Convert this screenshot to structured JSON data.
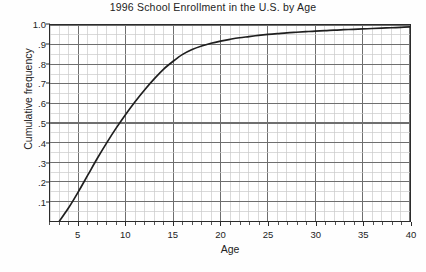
{
  "chart_data": {
    "type": "line",
    "title": "1996 School Enrollment in the U.S. by Age",
    "xlabel": "Age",
    "ylabel": "Cumulative frequency",
    "xlim": [
      2,
      40
    ],
    "ylim": [
      0,
      1.0
    ],
    "grid": true,
    "legend": null,
    "x_ticks": [
      5,
      10,
      15,
      20,
      25,
      30,
      35,
      40
    ],
    "x_tick_labels": [
      "5",
      "10",
      "15",
      "20",
      "25",
      "30",
      "35",
      "40"
    ],
    "y_ticks": [
      0.1,
      0.2,
      0.3,
      0.4,
      0.5,
      0.6,
      0.7,
      0.8,
      0.9,
      1.0
    ],
    "y_tick_labels": [
      ".1",
      ".2",
      ".3",
      ".4",
      ".5",
      ".6",
      ".7",
      ".8",
      ".9",
      "1.0"
    ],
    "x_minor_step": 1,
    "y_minor_step": 0.05,
    "series": [
      {
        "name": "Cumulative frequency of school enrollment",
        "x": [
          3,
          4,
          5,
          6,
          7,
          8,
          9,
          10,
          11,
          12,
          13,
          14,
          15,
          16,
          17,
          18,
          19,
          20,
          21,
          22,
          23,
          24,
          25,
          26,
          27,
          28,
          29,
          30,
          31,
          32,
          33,
          34,
          35,
          36,
          37,
          38,
          39,
          40
        ],
        "y": [
          0.0,
          0.07,
          0.15,
          0.235,
          0.32,
          0.4,
          0.475,
          0.545,
          0.61,
          0.67,
          0.725,
          0.775,
          0.815,
          0.85,
          0.875,
          0.893,
          0.907,
          0.918,
          0.927,
          0.935,
          0.941,
          0.947,
          0.952,
          0.956,
          0.96,
          0.963,
          0.966,
          0.969,
          0.971,
          0.974,
          0.976,
          0.978,
          0.98,
          0.982,
          0.984,
          0.986,
          0.988,
          0.99
        ]
      }
    ]
  },
  "colors": {
    "curve": "#1f1f1f",
    "axis": "#2b2b2b",
    "grid_major": "#6f6f6f",
    "grid_minor": "#c9c9c9",
    "background": "#fefefe",
    "text": "#232323"
  }
}
